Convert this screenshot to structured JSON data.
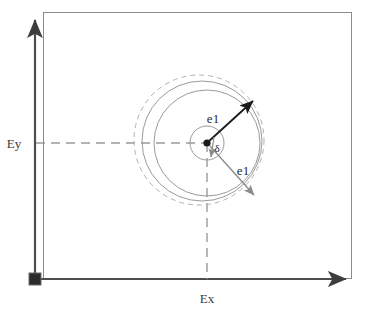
{
  "figure": {
    "type": "vector-diagram",
    "background_color": "#ffffff",
    "axes": {
      "x_label": "Ex",
      "y_label": "Ey",
      "axis_color": "#4d4d4d",
      "origin_marker": "filled-square"
    },
    "labels": {
      "vector_upper": "e1",
      "vector_lower": "e1",
      "angle": "δ"
    },
    "colors": {
      "frame": "#8c8c8c",
      "solid_circle": "#9a9a9a",
      "dashed_circle": "#b0b0b0",
      "dashed_guide": "#9a9a9a",
      "arrow_black": "#1a1a1a",
      "arrow_gray": "#8c8c8c",
      "center_dot": "#1a1a1a"
    },
    "geometry": {
      "frame": {
        "x": 43,
        "y": 12,
        "width": 309,
        "height": 267
      },
      "center": {
        "x": 207,
        "y": 143
      },
      "inner_circle_radius": 17,
      "solid_circle_1": {
        "cx": 207,
        "cy": 143,
        "r": 53
      },
      "solid_circle_2": {
        "cx": 202,
        "cy": 141,
        "r": 60
      },
      "dashed_circle": {
        "cx": 199,
        "cy": 140,
        "r": 65
      },
      "vector_upper": {
        "angle_deg": 42,
        "length": 62
      },
      "vector_lower": {
        "angle_deg": -52,
        "length": 62
      }
    }
  }
}
